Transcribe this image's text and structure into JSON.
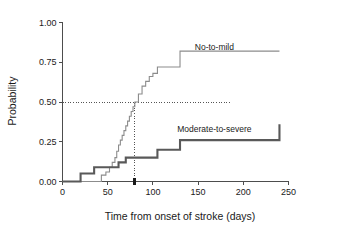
{
  "chart_data": {
    "type": "line",
    "title": "",
    "subtitle": "",
    "xlabel": "Time from onset of stroke (days)",
    "ylabel": "Probability",
    "xlim": [
      0,
      250
    ],
    "ylim": [
      0.0,
      1.0
    ],
    "xticks": [
      0,
      50,
      100,
      150,
      200,
      250
    ],
    "xtick_labels": [
      "0",
      "50",
      "100",
      "150",
      "200",
      "250"
    ],
    "yticks": [
      0.0,
      0.25,
      0.5,
      0.75,
      1.0
    ],
    "ytick_labels": [
      "0.00",
      "0.25",
      "0.50",
      "0.75",
      "1.00"
    ],
    "grid": false,
    "legend_position": "inline-right-of-curve",
    "step_style": "post",
    "series": [
      {
        "name": "No-to-mild",
        "color": "#8c8c8c",
        "line_width": 1.1,
        "label_x": 168,
        "label_y": 0.845,
        "x": [
          0,
          40,
          43,
          48,
          52,
          55,
          58,
          60,
          62,
          64,
          66,
          68,
          70,
          72,
          74,
          76,
          78,
          80,
          84,
          88,
          92,
          96,
          100,
          105,
          130,
          240
        ],
        "values": [
          0.0,
          0.0,
          0.04,
          0.06,
          0.09,
          0.12,
          0.15,
          0.19,
          0.23,
          0.26,
          0.29,
          0.32,
          0.35,
          0.38,
          0.41,
          0.44,
          0.47,
          0.5,
          0.55,
          0.6,
          0.63,
          0.66,
          0.68,
          0.72,
          0.82,
          0.82
        ]
      },
      {
        "name": "Moderate-to-severe",
        "color": "#595959",
        "line_width": 2.1,
        "label_x": 168,
        "label_y": 0.33,
        "x": [
          0,
          20,
          35,
          55,
          62,
          70,
          80,
          95,
          105,
          130,
          240
        ],
        "values": [
          0.0,
          0.05,
          0.09,
          0.09,
          0.12,
          0.15,
          0.15,
          0.15,
          0.2,
          0.26,
          0.36
        ]
      }
    ],
    "annotations": [
      {
        "name": "median-horizontal-reference",
        "type": "hline",
        "y": 0.5,
        "x_from": 0,
        "x_to": 185,
        "style": "dotted"
      },
      {
        "name": "median-vertical-reference",
        "type": "vline",
        "x": 80,
        "y_from": 0.0,
        "y_to": 0.5,
        "style": "dotted"
      },
      {
        "name": "median-axis-marker",
        "type": "marker",
        "x": 80,
        "y": 0.0,
        "shape": "tick-arrow"
      }
    ]
  }
}
